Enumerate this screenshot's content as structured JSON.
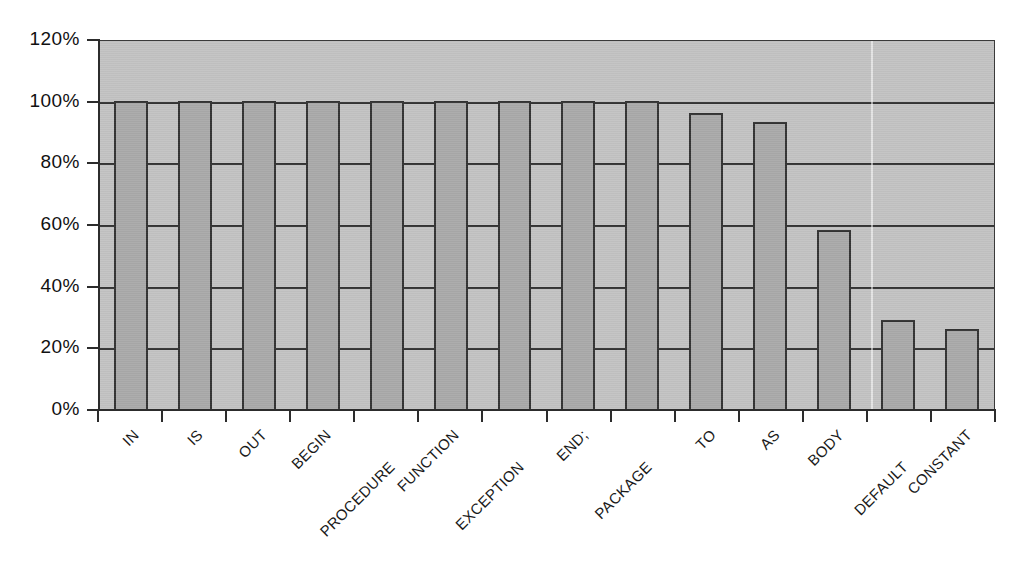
{
  "chart_data": {
    "type": "bar",
    "title": "",
    "subtitle": "",
    "xlabel": "",
    "ylabel": "",
    "categories": [
      "IN",
      "IS",
      "OUT",
      "BEGIN",
      "PROCEDURE",
      "FUNCTION",
      "EXCEPTION",
      "END;",
      "PACKAGE",
      "TO",
      "AS",
      "BODY",
      "DEFAULT",
      "CONSTANT"
    ],
    "values": [
      100,
      100,
      100,
      100,
      100,
      100,
      100,
      100,
      100,
      96,
      93,
      58,
      29,
      26
    ],
    "value_unit": "%",
    "ylim": [
      0,
      120
    ],
    "ytick_values": [
      0,
      20,
      40,
      60,
      80,
      100,
      120
    ],
    "ytick_labels": [
      "0%",
      "20%",
      "40%",
      "60%",
      "80%",
      "100%",
      "120%"
    ],
    "grid": "horizontal",
    "legend": "none",
    "series": [
      {
        "name": "",
        "values": [
          100,
          100,
          100,
          100,
          100,
          100,
          100,
          100,
          100,
          96,
          93,
          58,
          29,
          26
        ]
      }
    ],
    "colors": {
      "plot_background": "#c3c3c3",
      "bar_fill": "#aaaaaa",
      "bar_border": "#333333",
      "gridline": "#343434",
      "axis": "#2c2c2c",
      "text": "#111111",
      "page_background": "#ffffff"
    }
  }
}
